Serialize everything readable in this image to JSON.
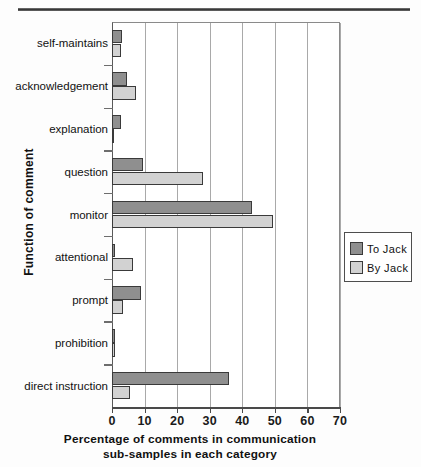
{
  "chart_data": {
    "type": "bar",
    "orientation": "horizontal",
    "title": "",
    "xlabel": "Percentage of comments in communication sub-samples in each category",
    "xlabel_line1": "Percentage of comments in communication",
    "xlabel_line2": "sub-samples in each category",
    "ylabel": "Function of comment",
    "categories": [
      "self-maintains",
      "acknowledgement",
      "explanation",
      "question",
      "monitor",
      "attentional",
      "prompt",
      "prohibition",
      "direct instruction"
    ],
    "series": [
      {
        "name": "To  Jack",
        "color": "#8f8f8f",
        "values": [
          3.0,
          4.5,
          2.8,
          9.5,
          43.0,
          0.8,
          9.0,
          1.0,
          36.0
        ]
      },
      {
        "name": "By  Jack",
        "color": "#d2d2d2",
        "values": [
          2.7,
          7.5,
          0.5,
          28.0,
          49.5,
          6.5,
          3.3,
          0.9,
          5.5
        ]
      }
    ],
    "xlim": [
      0,
      70
    ],
    "xticks": [
      0,
      10,
      20,
      30,
      40,
      50,
      60,
      70
    ],
    "xtick_labels": [
      "0",
      "10",
      "20",
      "30",
      "40",
      "50",
      "60",
      "70"
    ],
    "grid": "vertical",
    "legend_position": "right"
  },
  "legend": {
    "entries": [
      {
        "label": "To  Jack",
        "color": "#8f8f8f"
      },
      {
        "label": "By  Jack",
        "color": "#d2d2d2"
      }
    ]
  }
}
